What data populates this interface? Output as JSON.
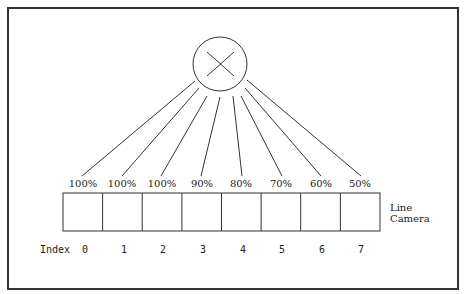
{
  "diagram": {
    "light_source": {
      "icon": "circle-x-icon",
      "label": ""
    },
    "camera_label_line1": "Line",
    "camera_label_line2": "Camera",
    "index_label": "Index",
    "pixels": [
      {
        "index": "0",
        "intensity": "100%"
      },
      {
        "index": "1",
        "intensity": "100%"
      },
      {
        "index": "2",
        "intensity": "100%"
      },
      {
        "index": "3",
        "intensity": "90%"
      },
      {
        "index": "4",
        "intensity": "80%"
      },
      {
        "index": "5",
        "intensity": "70%"
      },
      {
        "index": "6",
        "intensity": "60%"
      },
      {
        "index": "7",
        "intensity": "50%"
      }
    ]
  }
}
